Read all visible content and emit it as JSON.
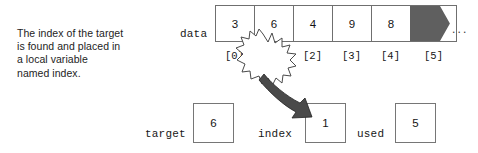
{
  "figure": {
    "caption": {
      "lines": [
        "The index of the target",
        "is found and placed in",
        "a local variable",
        "named index."
      ]
    },
    "array": {
      "label": "data",
      "cells": [
        "3",
        "6",
        "4",
        "9",
        "8"
      ],
      "unused_cell_fill": "#5f5f5f",
      "trailing_ellipsis": "...",
      "index_labels": [
        "[0]",
        "[1]",
        "[2]",
        "[3]",
        "[4]",
        "[5]"
      ],
      "highlighted_index": "[1]"
    },
    "variables": [
      {
        "name": "target",
        "value": "6"
      },
      {
        "name": "index",
        "value": "1"
      },
      {
        "name": "used",
        "value": "5"
      }
    ],
    "annotations": {
      "starburst_target": "[1]",
      "arrow_from": "[1]",
      "arrow_to": "index"
    },
    "colors": {
      "box_border": "#6f6f6f",
      "unused_fill": "#5f5f5f",
      "arrow_fill": "#4a4a4a",
      "text": "#1a1a1a",
      "background": "#ffffff"
    }
  }
}
